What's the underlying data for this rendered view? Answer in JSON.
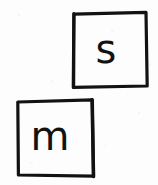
{
  "image": {
    "kind": "scanned-handwriting",
    "background_color": "#fdfdfd",
    "ink_color": "#121212",
    "width": 158,
    "height": 185
  },
  "boxes": [
    {
      "id": "box-s",
      "letter": "s",
      "description": "hand-drawn square containing handwritten lowercase letter s",
      "position": "top-right",
      "x": 73,
      "y": 12,
      "width": 74,
      "height": 75,
      "stroke_width": 3,
      "ink_color": "#121212"
    },
    {
      "id": "box-m",
      "letter": "m",
      "description": "hand-drawn square containing handwritten lowercase letter m",
      "position": "bottom-left",
      "x": 17,
      "y": 100,
      "width": 75,
      "height": 75,
      "stroke_width": 3,
      "ink_color": "#121212"
    }
  ]
}
